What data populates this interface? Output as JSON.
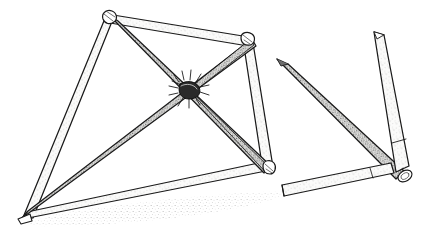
{
  "figure": {
    "caption": "Pencil line drawing: a tetrahedral frame of lashed sticks at left with a bound central junction, and three loose sticks at right.",
    "medium": "pencil line drawing with stipple shading",
    "background_color": "#ffffff",
    "ink_color": "#1a1a1a",
    "light_fill_color": "#f2f2f0",
    "mid_fill_color": "#bdbdbd",
    "dark_fill_color": "#6e6e6e",
    "shadow_color": "#9a9a9a",
    "width": 433,
    "height": 239
  },
  "groups": [
    {
      "id": "frame-assembly",
      "label": "Lashed tetrahedral stick frame",
      "interactable": false
    },
    {
      "id": "loose-sticks",
      "label": "Three loose sticks group",
      "interactable": false
    },
    {
      "id": "ground-shadow",
      "label": "Stippled ground shadow",
      "interactable": false
    }
  ],
  "vertices": {
    "apex_top": {
      "label": "top apex",
      "x": 108,
      "y": 17
    },
    "vertex_right": {
      "label": "right vertex",
      "x": 247,
      "y": 41
    },
    "vertex_bottom_left": {
      "label": "bottom left vertex",
      "x": 23,
      "y": 219
    },
    "vertex_bottom_right": {
      "label": "bottom right vertex",
      "x": 268,
      "y": 172
    },
    "junction_center": {
      "label": "lashed center junction",
      "x": 189,
      "y": 90
    }
  },
  "sticks": [
    {
      "name": "stick-apex-to-bottom-left",
      "tone": "light",
      "from": "apex_top",
      "to": "vertex_bottom_left"
    },
    {
      "name": "stick-apex-to-right-vertex",
      "tone": "light",
      "from": "apex_top",
      "to": "vertex_right"
    },
    {
      "name": "stick-apex-to-center-junction",
      "tone": "dark",
      "from": "apex_top",
      "to": "junction_center"
    },
    {
      "name": "stick-right-vertex-to-bottom-right",
      "tone": "light",
      "from": "vertex_right",
      "to": "vertex_bottom_right"
    },
    {
      "name": "stick-bottom-left-to-bottom-right",
      "tone": "light",
      "from": "vertex_bottom_left",
      "to": "vertex_bottom_right"
    },
    {
      "name": "stick-bottom-left-to-center-junction",
      "tone": "dark",
      "from": "vertex_bottom_left",
      "to": "junction_center"
    },
    {
      "name": "stick-center-junction-to-bottom-right",
      "tone": "dark",
      "from": "junction_center",
      "to": "vertex_bottom_right"
    },
    {
      "name": "stick-center-junction-to-right-vertex",
      "tone": "dark",
      "from": "junction_center",
      "to": "vertex_right"
    },
    {
      "name": "loose-stick-diagonal-dark",
      "tone": "dark",
      "from": "x278y62",
      "to": "x400y176"
    },
    {
      "name": "loose-stick-vertical-light",
      "tone": "light",
      "from": "x378y33",
      "to": "x404y172"
    },
    {
      "name": "loose-stick-horizontal-light",
      "tone": "light",
      "from": "x283y194",
      "to": "x393y169"
    }
  ],
  "details": {
    "lashing": {
      "name": "center-lashing",
      "label": "cord lashing at junction"
    },
    "cut_end": {
      "name": "cut-stick-end",
      "label": "cut stick end ellipse",
      "x": 405,
      "y": 175
    },
    "shadow": {
      "name": "ground-shadow",
      "label": "stippled cast shadow"
    }
  }
}
